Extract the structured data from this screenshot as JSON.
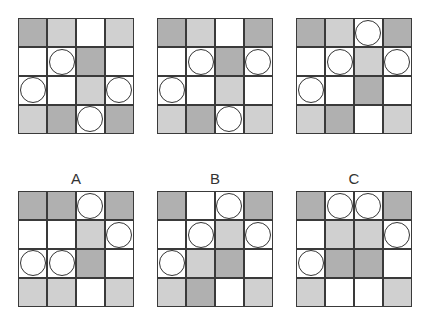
{
  "colors": {
    "dark": "#b0b0b0",
    "light": "#d0d0d0",
    "white": "#ffffff",
    "border": "#3a3a3a"
  },
  "sequence": [
    {
      "id": "seq-1",
      "cells": [
        [
          "dark",
          "light",
          "white",
          "light"
        ],
        [
          "white",
          "circle",
          "dark",
          "white"
        ],
        [
          "circle",
          "white",
          "light",
          "circle"
        ],
        [
          "light",
          "dark",
          "circle",
          "dark"
        ]
      ]
    },
    {
      "id": "seq-2",
      "cells": [
        [
          "dark",
          "light",
          "white",
          "dark"
        ],
        [
          "white",
          "circle",
          "dark",
          "circle"
        ],
        [
          "circle",
          "white",
          "light",
          "white"
        ],
        [
          "light",
          "dark",
          "circle",
          "light"
        ]
      ]
    },
    {
      "id": "seq-3",
      "cells": [
        [
          "dark",
          "light",
          "circle",
          "dark"
        ],
        [
          "white",
          "circle",
          "light",
          "circle"
        ],
        [
          "circle",
          "white",
          "dark",
          "white"
        ],
        [
          "light",
          "dark",
          "white",
          "light"
        ]
      ]
    }
  ],
  "options": [
    {
      "label": "A",
      "cells": [
        [
          "dark",
          "dark",
          "circle",
          "dark"
        ],
        [
          "white",
          "white",
          "light",
          "circle"
        ],
        [
          "circle",
          "circle",
          "dark",
          "white"
        ],
        [
          "light",
          "light",
          "white",
          "light"
        ]
      ]
    },
    {
      "label": "B",
      "cells": [
        [
          "dark",
          "white",
          "circle",
          "dark"
        ],
        [
          "white",
          "circle",
          "light",
          "circle"
        ],
        [
          "circle",
          "light",
          "dark",
          "white"
        ],
        [
          "light",
          "dark",
          "white",
          "light"
        ]
      ]
    },
    {
      "label": "C",
      "cells": [
        [
          "dark",
          "circle",
          "circle",
          "dark"
        ],
        [
          "white",
          "light",
          "light",
          "circle"
        ],
        [
          "circle",
          "dark",
          "dark",
          "white"
        ],
        [
          "light",
          "white",
          "white",
          "light"
        ]
      ]
    }
  ]
}
